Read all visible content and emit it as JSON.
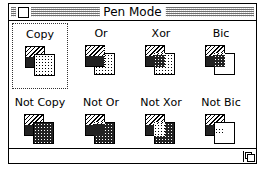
{
  "window": {
    "title": "Pen Mode",
    "close_box_icon": "close-box-icon",
    "grow_box_icon": "grow-box-icon"
  },
  "modes": [
    {
      "label": "Copy",
      "selected": true
    },
    {
      "label": "Or",
      "selected": false
    },
    {
      "label": "Xor",
      "selected": false
    },
    {
      "label": "Bic",
      "selected": false
    },
    {
      "label": "Not Copy",
      "selected": false
    },
    {
      "label": "Not Or",
      "selected": false
    },
    {
      "label": "Not Xor",
      "selected": false
    },
    {
      "label": "Not Bic",
      "selected": false
    }
  ],
  "colors": {
    "foreground": "#000000",
    "background": "#ffffff"
  }
}
